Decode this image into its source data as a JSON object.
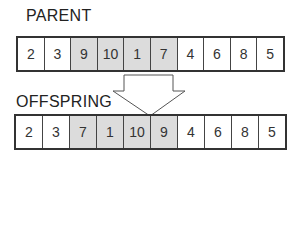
{
  "parent": {
    "label": "PARENT",
    "genes": [
      {
        "value": "2",
        "highlighted": false
      },
      {
        "value": "3",
        "highlighted": false
      },
      {
        "value": "9",
        "highlighted": true
      },
      {
        "value": "10",
        "highlighted": true
      },
      {
        "value": "1",
        "highlighted": true
      },
      {
        "value": "7",
        "highlighted": true
      },
      {
        "value": "4",
        "highlighted": false
      },
      {
        "value": "6",
        "highlighted": false
      },
      {
        "value": "8",
        "highlighted": false
      },
      {
        "value": "5",
        "highlighted": false
      }
    ]
  },
  "offspring": {
    "label": "OFFSPRING",
    "genes": [
      {
        "value": "2",
        "highlighted": false
      },
      {
        "value": "3",
        "highlighted": false
      },
      {
        "value": "7",
        "highlighted": true
      },
      {
        "value": "1",
        "highlighted": true
      },
      {
        "value": "10",
        "highlighted": true
      },
      {
        "value": "9",
        "highlighted": true
      },
      {
        "value": "4",
        "highlighted": false
      },
      {
        "value": "6",
        "highlighted": false
      },
      {
        "value": "8",
        "highlighted": false
      },
      {
        "value": "5",
        "highlighted": false
      }
    ]
  },
  "colors": {
    "highlight": "#dcdcdc",
    "border": "#333333"
  }
}
